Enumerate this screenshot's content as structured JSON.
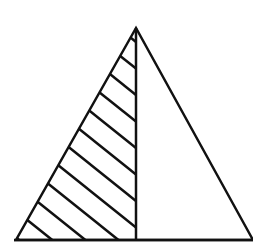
{
  "diagram": {
    "type": "geometry",
    "stroke_color": "#111111",
    "background_color": "#ffffff",
    "stroke_width": 2.5,
    "apex": [
      136,
      28
    ],
    "base_left": [
      16,
      240
    ],
    "base_right": [
      253,
      240
    ],
    "altitude_foot": [
      136,
      240
    ],
    "hatch": {
      "region": "left",
      "slope": 0.8,
      "spacing": 26.5,
      "count": 13
    }
  }
}
